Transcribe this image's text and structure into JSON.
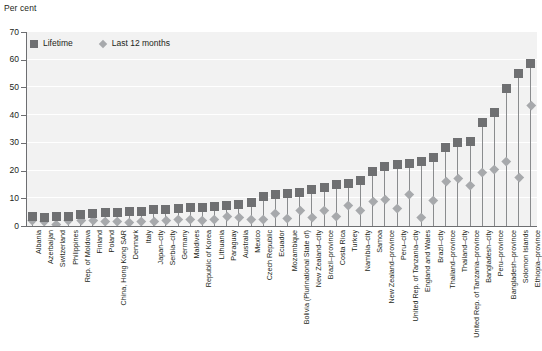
{
  "chart_data": {
    "type": "scatter",
    "title": "",
    "subtitle": "",
    "ylabel": "Per cent",
    "xlabel": "",
    "ylim": [
      0,
      70
    ],
    "yticks": [
      0,
      10,
      20,
      30,
      40,
      50,
      60,
      70
    ],
    "grid": true,
    "legend_position": "top-left",
    "legend": [
      "Lifetime",
      "Last 12 months"
    ],
    "colors": {
      "lifetime": "#6f7072",
      "last12": "#a7a9ac",
      "plot_background": "#f2f2f2",
      "gridline": "#ffffff",
      "axis": "#6d6e71",
      "text": "#231f20"
    },
    "categories": [
      "Albania",
      "Azerbaijan",
      "Switzerland",
      "Philippines",
      "Rep. of Moldova",
      "Finland",
      "Poland",
      "China, Hong Kong SAR",
      "Denmark",
      "Italy",
      "Japan–city",
      "Serbia–city",
      "Germany",
      "Maldives",
      "Republic of Korea",
      "Lithuania",
      "Paraguay",
      "Australia",
      "Mexico",
      "Czech Republic",
      "Ecuador",
      "Mozambique",
      "Bolivia (Plurinational State of)",
      "New Zealand–city",
      "Brazil–province",
      "Costa Rica",
      "Turkey",
      "Namibia–city",
      "Samoa",
      "New Zealand–province",
      "Peru–city",
      "United Rep. of Tanzania–city",
      "England and Wales",
      "Brazil–city",
      "Thailand–province",
      "Thailand–city",
      "United Rep. of Tanzania–province",
      "Bangladesh–city",
      "Peru–province",
      "Bangladesh–province",
      "Solomon Islands",
      "Ethiopia–province"
    ],
    "series": [
      {
        "name": "Lifetime",
        "marker": "square",
        "values": [
          3.5,
          3.2,
          3.4,
          3.5,
          4.0,
          4.6,
          4.8,
          5.0,
          5.2,
          5.4,
          5.8,
          6.0,
          6.4,
          6.6,
          6.8,
          7.0,
          7.4,
          7.6,
          8.6,
          10.8,
          11.2,
          11.8,
          12.0,
          13.0,
          14.0,
          14.8,
          15.4,
          16.4,
          19.8,
          21.6,
          22.2,
          22.6,
          23.4,
          24.8,
          28.4,
          30.0,
          30.6,
          37.2,
          41.0,
          49.6,
          55.0,
          58.6
        ]
      },
      {
        "name": "Last 12 months",
        "marker": "diamond",
        "values": [
          2.0,
          1.6,
          0.6,
          2.0,
          2.2,
          2.0,
          1.8,
          1.6,
          1.4,
          1.6,
          1.8,
          2.0,
          2.4,
          2.4,
          2.2,
          2.6,
          3.4,
          3.0,
          2.4,
          2.6,
          4.6,
          2.8,
          5.6,
          3.0,
          5.6,
          3.4,
          7.4,
          5.8,
          9.0,
          9.6,
          6.4,
          11.4,
          3.0,
          9.2,
          16.0,
          17.4,
          14.8,
          19.4,
          20.6,
          23.4,
          17.6,
          43.6
        ]
      }
    ]
  }
}
